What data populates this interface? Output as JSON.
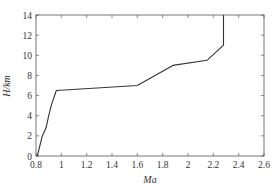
{
  "chart_data": {
    "type": "line",
    "title": "",
    "xlabel": "Ma",
    "ylabel": "H/km",
    "xlim": [
      0.8,
      2.6
    ],
    "ylim": [
      0,
      14
    ],
    "xticks": [
      0.8,
      1,
      1.2,
      1.4,
      1.6,
      1.8,
      2,
      2.2,
      2.4,
      2.6
    ],
    "xtick_labels": [
      "0.8",
      "1",
      "1.2",
      "1.4",
      "1.6",
      "1.8",
      "2",
      "2.2",
      "2.4",
      "2.6"
    ],
    "yticks": [
      0,
      2,
      4,
      6,
      8,
      10,
      12,
      14
    ],
    "ytick_labels": [
      "0",
      "2",
      "4",
      "6",
      "8",
      "10",
      "12",
      "14"
    ],
    "grid": false,
    "legend": null,
    "series": [
      {
        "name": "Flight profile",
        "color": "#333333",
        "x": [
          0.81,
          0.85,
          0.88,
          0.9,
          0.92,
          0.96,
          1.6,
          1.88,
          2.15,
          2.28,
          2.28
        ],
        "y": [
          0,
          2,
          2.8,
          4.0,
          5.0,
          6.5,
          7.0,
          9.0,
          9.5,
          11.0,
          14.0
        ]
      }
    ]
  }
}
